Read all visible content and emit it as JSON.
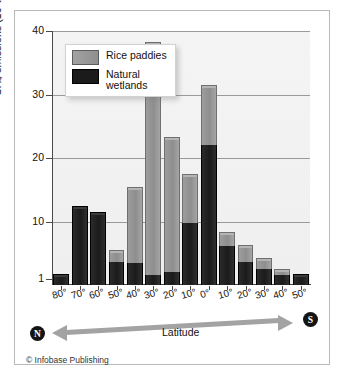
{
  "chart_data": {
    "type": "bar",
    "subtype": "stacked-bar",
    "title": "",
    "xlabel": "Latitude",
    "ylabel": "CH4 emissions (10^6 t)",
    "ylabel_display": "CH4 emissions (106t)",
    "ylim": [
      1,
      40
    ],
    "yticks": [
      1,
      10,
      20,
      30,
      40
    ],
    "grid": true,
    "legend_position": "top-left-inside",
    "categories": [
      "80°",
      "70°",
      "60°",
      "50°",
      "40°",
      "30°",
      "20°",
      "10°",
      "0°",
      "10°",
      "20°",
      "30°",
      "40°",
      "50°"
    ],
    "hemispheres": [
      "N",
      "N",
      "N",
      "N",
      "N",
      "N",
      "N",
      "N",
      "0",
      "S",
      "S",
      "S",
      "S",
      "S"
    ],
    "series": [
      {
        "name": "Natural wetlands",
        "color": "#1b1b1b",
        "values": [
          1.2,
          12.0,
          11.0,
          3.7,
          3.4,
          1.6,
          2.0,
          9.8,
          22.0,
          6.2,
          3.6,
          2.6,
          1.6,
          1.2
        ]
      },
      {
        "name": "Rice paddies",
        "color": "#979797",
        "values": [
          0.0,
          0.0,
          0.0,
          1.3,
          11.6,
          36.2,
          20.8,
          7.2,
          9.0,
          1.6,
          2.3,
          1.2,
          0.5,
          0.0
        ]
      }
    ],
    "totals": [
      1.2,
      12.0,
      11.0,
      5.0,
      15.0,
      37.8,
      22.8,
      17.0,
      31.0,
      7.8,
      5.9,
      3.8,
      2.1,
      1.2
    ],
    "annotations": {
      "north_marker": "N",
      "south_marker": "S",
      "axis_arrow": "double-headed"
    }
  },
  "axes": {
    "y_ticks": [
      {
        "label": "40",
        "value": 40
      },
      {
        "label": "30",
        "value": 30
      },
      {
        "label": "20",
        "value": 20
      },
      {
        "label": "10",
        "value": 10
      },
      {
        "label": "1",
        "value": 1
      }
    ],
    "y_title_main": "CH",
    "y_title_sub": "4",
    "y_title_rest": " emissions (10",
    "y_title_sup": "6",
    "y_title_end": "t)"
  },
  "legend": {
    "items": [
      {
        "label": "Rice paddies",
        "swatch": "gray"
      },
      {
        "label": "Natural\nwetlands",
        "swatch": "black"
      }
    ]
  },
  "footer": {
    "latitude_label": "Latitude",
    "north_badge": "N",
    "south_badge": "S",
    "credit": "© Infobase Publishing"
  },
  "colors": {
    "rice_paddies": "#979797",
    "natural_wetlands": "#1b1b1b",
    "plot_background": "#f2f2f2",
    "gridline": "#9a9a9a",
    "frame_border": "#b9b9b9",
    "arrow": "#a3a3a3"
  }
}
